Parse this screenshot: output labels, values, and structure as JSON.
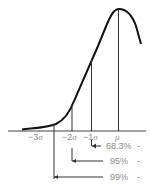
{
  "diagram": {
    "title": "",
    "type": "normal-distribution-left-half",
    "axis_labels": [
      {
        "id": "minus3",
        "num": "−3",
        "sym": "σ"
      },
      {
        "id": "minus2",
        "num": "−2",
        "sym": "σ"
      },
      {
        "id": "minus1",
        "num": "−1",
        "sym": "σ"
      },
      {
        "id": "mu",
        "num": "",
        "sym": "μ"
      }
    ],
    "intervals": [
      {
        "label": "68.3%",
        "from": "−1σ"
      },
      {
        "label": "95%",
        "from": "−2σ"
      },
      {
        "label": "99%",
        "from": "−3σ"
      }
    ],
    "tick_mark": "-",
    "colors": {
      "curve": "#111111",
      "lines": "#333333",
      "text": "#8a8a8a"
    }
  }
}
